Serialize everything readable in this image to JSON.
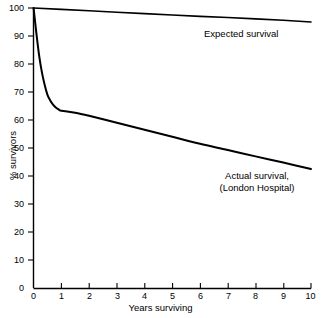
{
  "chart_data": {
    "type": "line",
    "title": "",
    "subtitle": "",
    "xlabel": "Years surviving",
    "ylabel": "% survivors",
    "xlim": [
      0,
      10
    ],
    "ylim": [
      0,
      100
    ],
    "grid": false,
    "legend_position": "inline-annotation",
    "background_color": "#ffffff",
    "line_color": "#000000",
    "axis_color": "#000000",
    "xticks": [
      0,
      1,
      2,
      3,
      4,
      5,
      6,
      7,
      8,
      9,
      10
    ],
    "xtick_labels": [
      "0",
      "1",
      "2",
      "3",
      "4",
      "5",
      "6",
      "7",
      "8",
      "9",
      "10"
    ],
    "yticks": [
      0,
      10,
      20,
      30,
      40,
      50,
      60,
      70,
      80,
      90,
      100
    ],
    "ytick_labels": [
      "0",
      "10",
      "20",
      "30",
      "40",
      "50",
      "60",
      "70",
      "80",
      "90",
      "100"
    ],
    "series": [
      {
        "name": "Expected survival",
        "annotation": "Expected survival",
        "x": [
          0,
          1,
          2,
          3,
          4,
          5,
          6,
          7,
          8,
          9,
          10
        ],
        "values": [
          100,
          99.5,
          99,
          98.5,
          98,
          97.5,
          97,
          96.6,
          96.1,
          95.6,
          95
        ]
      },
      {
        "name": "Actual survival (London Hospital)",
        "annotation_line1": "Actual survival,",
        "annotation_line2": "(London Hospital)",
        "x": [
          0,
          0.1,
          0.2,
          0.3,
          0.4,
          0.5,
          0.6,
          0.7,
          0.8,
          0.9,
          1,
          1.5,
          2,
          3,
          4,
          5,
          6,
          7,
          8,
          9,
          10
        ],
        "values": [
          100,
          91,
          83,
          77,
          72.5,
          69,
          67,
          65.5,
          64.5,
          63.8,
          63.3,
          62.6,
          61.5,
          59,
          56.5,
          54,
          51.5,
          49.3,
          47,
          44.8,
          42.5
        ]
      }
    ]
  },
  "axes": {
    "x_title": "Years surviving",
    "y_title": "% survivors"
  },
  "annotations": {
    "expected": "Expected survival",
    "actual_line1": "Actual survival,",
    "actual_line2": "(London Hospital)"
  },
  "ticks": {
    "y": [
      "100",
      "90",
      "80",
      "70",
      "60",
      "50",
      "40",
      "30",
      "20",
      "10",
      "0"
    ],
    "x": [
      "0",
      "1",
      "2",
      "3",
      "4",
      "5",
      "6",
      "7",
      "8",
      "9",
      "10"
    ]
  }
}
